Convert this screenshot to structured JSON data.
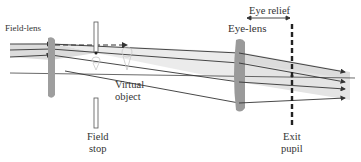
{
  "diagram": {
    "type": "optical ray diagram",
    "labels": {
      "field_lens": "Field-lens",
      "eye_lens": "Eye-lens",
      "eye_relief": "Eye relief",
      "virtual_object_line1": "Virtual",
      "virtual_object_line2": "object",
      "field_stop_line1": "Field",
      "field_stop_line2": "stop",
      "exit_pupil_line1": "Exit",
      "exit_pupil_line2": "pupil"
    },
    "colors": {
      "lens": "#9a9a9a",
      "ray": "#333333",
      "beam_fill": "#d8d8d8",
      "stop": "#222222"
    },
    "elements": [
      {
        "name": "field-lens",
        "x": 51
      },
      {
        "name": "field-stop",
        "x": 96
      },
      {
        "name": "virtual-object",
        "x": 127
      },
      {
        "name": "eye-lens",
        "x": 239
      },
      {
        "name": "exit-pupil",
        "x": 292
      }
    ]
  }
}
